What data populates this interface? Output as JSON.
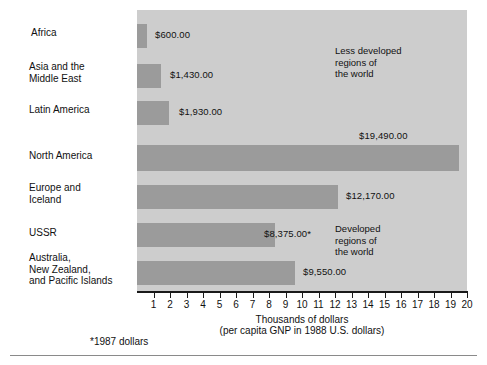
{
  "chart_data": {
    "type": "bar",
    "orientation": "horizontal",
    "title": "",
    "xlabel": "Thousands of dollars",
    "xlabel_sub": "(per capita GNP in 1988 U.S. dollars)",
    "ylabel": "",
    "xlim": [
      0,
      20
    ],
    "grid": false,
    "legend": "none",
    "tick_labels": [
      "1",
      "2",
      "3",
      "4",
      "5",
      "6",
      "7",
      "8",
      "9",
      "10",
      "11",
      "12",
      "13",
      "14",
      "15",
      "16",
      "17",
      "18",
      "19",
      "20"
    ],
    "tick_values": [
      1,
      2,
      3,
      4,
      5,
      6,
      7,
      8,
      9,
      10,
      11,
      12,
      13,
      14,
      15,
      16,
      17,
      18,
      19,
      20
    ],
    "categories": [
      "Africa",
      "Asia and the\nMiddle East",
      "Latin America",
      "North America",
      "Europe and\nIceland",
      "USSR",
      "Australia,\nNew Zealand,\nand Pacific Islands"
    ],
    "values": [
      600,
      1430,
      1930,
      19490,
      12170,
      8375,
      9550
    ],
    "value_labels": [
      "$600.00",
      "$1,430.00",
      "$1,930.00",
      "$19,490.00",
      "$12,170.00",
      "$8,375.00*",
      "$9,550.00"
    ],
    "annotations": [
      "Less developed\nregions of\nthe world",
      "Developed\nregions of\nthe world"
    ],
    "footnote": "*1987 dollars",
    "colors": {
      "bar": "#9b9b9b",
      "plot_background": "#cdcdcd",
      "axis": "#1a1a1a",
      "text": "#111111",
      "page_background": "#ffffff"
    }
  },
  "footnote": {
    "text": "*1987 dollars"
  },
  "axis": {
    "caption_main": "Thousands of dollars",
    "caption_sub": "(per capita GNP in 1988 U.S. dollars)"
  }
}
